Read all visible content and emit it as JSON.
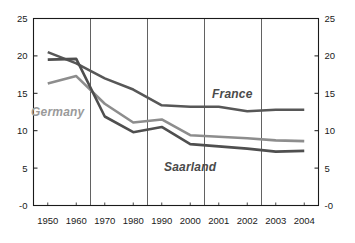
{
  "chart_data": {
    "type": "line",
    "title": "",
    "subtitle": "",
    "xlabel": "",
    "ylabel": "",
    "categories": [
      "1950",
      "1960",
      "1970",
      "1980",
      "1990",
      "2000",
      "2001",
      "2002",
      "2003",
      "2004"
    ],
    "x_tick_labels": [
      "1950",
      "1960",
      "1970",
      "1980",
      "1990",
      "2000",
      "2001",
      "2002",
      "2003",
      "2004"
    ],
    "y_tick_labels": [
      "25",
      "20",
      "15",
      "10",
      "5",
      "-0"
    ],
    "y_tick_values": [
      25,
      20,
      15,
      10,
      5,
      0
    ],
    "ylim": [
      0,
      25
    ],
    "grid": "vertical",
    "gridlines_after_categories": [
      "1960",
      "1980",
      "2000",
      "2002"
    ],
    "legend": "inline-annotations",
    "dual_y_axis": true,
    "series": [
      {
        "name": "France",
        "label": "France",
        "color": "#575757",
        "values": [
          20.5,
          19.0,
          17.0,
          15.5,
          13.4,
          13.2,
          13.2,
          12.6,
          12.8,
          12.8
        ]
      },
      {
        "name": "Germany",
        "label": "Germany",
        "color": "#8d8d8d",
        "values": [
          16.3,
          17.3,
          13.6,
          11.1,
          11.5,
          9.4,
          9.2,
          9.0,
          8.7,
          8.6
        ]
      },
      {
        "name": "Saarland",
        "label": "Saarland",
        "color": "#4f4f4f",
        "values": [
          19.5,
          19.6,
          11.9,
          9.8,
          10.5,
          8.2,
          7.9,
          7.6,
          7.2,
          7.3
        ]
      }
    ],
    "annotations": [
      {
        "text": "Germany",
        "series": "Germany",
        "color": "#9a9a9a"
      },
      {
        "text": "France",
        "series": "France",
        "color": "#4a4a4a"
      },
      {
        "text": "Saarland",
        "series": "Saarland",
        "color": "#4a4a4a"
      }
    ]
  }
}
